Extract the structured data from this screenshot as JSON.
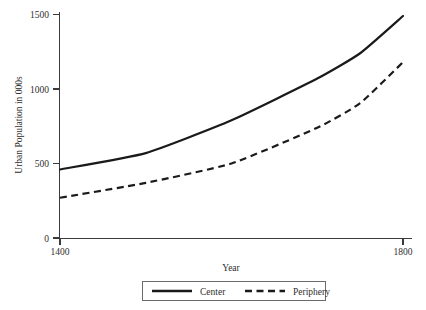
{
  "chart_data": {
    "type": "line",
    "title": "",
    "subtitle": "",
    "xlabel": "Year",
    "ylabel": "Urban Population in 000s",
    "x": [
      1400,
      1500,
      1600,
      1700,
      1750,
      1800
    ],
    "xlim": [
      1400,
      1800
    ],
    "ylim": [
      0,
      1500
    ],
    "xticks": [
      1400,
      1800
    ],
    "xtick_labels": [
      "1400",
      "1800"
    ],
    "yticks": [
      0,
      500,
      1000,
      1500
    ],
    "ytick_labels": [
      "0",
      "500",
      "1000",
      "1500"
    ],
    "grid": false,
    "legend_position": "bottom",
    "series": [
      {
        "name": "Center",
        "style": "solid",
        "color": "#1a1a1a",
        "values": [
          460,
          570,
          790,
          1070,
          1240,
          1490
        ]
      },
      {
        "name": "Periphery",
        "style": "dashed",
        "color": "#1a1a1a",
        "values": [
          270,
          370,
          500,
          740,
          905,
          1180
        ]
      }
    ]
  },
  "axes": {
    "y_title": "Urban Population in 000s",
    "x_title": "Year",
    "y_tick_labels": [
      "1500",
      "1000",
      "500",
      "0"
    ],
    "x_tick_labels": [
      "1400",
      "1800"
    ]
  },
  "legend": {
    "items": [
      {
        "label": "Center",
        "style": "solid"
      },
      {
        "label": "Periphery",
        "style": "dashed"
      }
    ]
  }
}
